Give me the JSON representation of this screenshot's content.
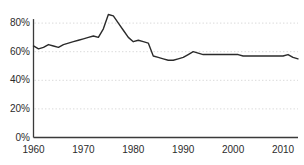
{
  "chart_data": {
    "type": "line",
    "title": "",
    "subtitle": "",
    "xlabel": "",
    "ylabel": "",
    "xlim": [
      1960,
      2013
    ],
    "ylim": [
      0,
      90
    ],
    "grid": true,
    "grid_orientation": "horizontal",
    "grid_style": "dotted",
    "legend": "none",
    "line_color": "#2b2b2b",
    "grid_color": "#d9d9d9",
    "axis_color": "#3a3a3a",
    "background": "#ffffff",
    "y_ticks": [
      {
        "value": 0,
        "label": "0%"
      },
      {
        "value": 20,
        "label": "20%"
      },
      {
        "value": 40,
        "label": "40%"
      },
      {
        "value": 60,
        "label": "60%"
      },
      {
        "value": 80,
        "label": "80%"
      }
    ],
    "x_ticks": [
      {
        "value": 1960,
        "label": "1960"
      },
      {
        "value": 1970,
        "label": "1970"
      },
      {
        "value": 1980,
        "label": "1980"
      },
      {
        "value": 1990,
        "label": "1990"
      },
      {
        "value": 2000,
        "label": "2000"
      },
      {
        "value": 2010,
        "label": "2010"
      }
    ],
    "x": [
      1960,
      1961,
      1962,
      1963,
      1964,
      1965,
      1966,
      1967,
      1968,
      1969,
      1970,
      1971,
      1972,
      1973,
      1974,
      1975,
      1976,
      1977,
      1978,
      1979,
      1980,
      1981,
      1982,
      1983,
      1984,
      1985,
      1986,
      1987,
      1988,
      1989,
      1990,
      1991,
      1992,
      1993,
      1994,
      1995,
      1996,
      1997,
      1998,
      1999,
      2000,
      2001,
      2002,
      2003,
      2004,
      2005,
      2006,
      2007,
      2008,
      2009,
      2010,
      2011,
      2012,
      2013
    ],
    "values": [
      64,
      62,
      63,
      65,
      64,
      63,
      65,
      66,
      67,
      68,
      69,
      70,
      71,
      70,
      76,
      86,
      85,
      80,
      75,
      70,
      67,
      68,
      67,
      66,
      57,
      56,
      55,
      54,
      54,
      55,
      56,
      58,
      60,
      59,
      58,
      58,
      58,
      58,
      58,
      58,
      58,
      58,
      57,
      57,
      57,
      57,
      57,
      57,
      57,
      57,
      57,
      58,
      56,
      55
    ],
    "annotations": [
      {
        "text": "peak",
        "x": 1975,
        "y": 86
      },
      {
        "text": "trough",
        "x": 1988,
        "y": 54
      }
    ]
  }
}
